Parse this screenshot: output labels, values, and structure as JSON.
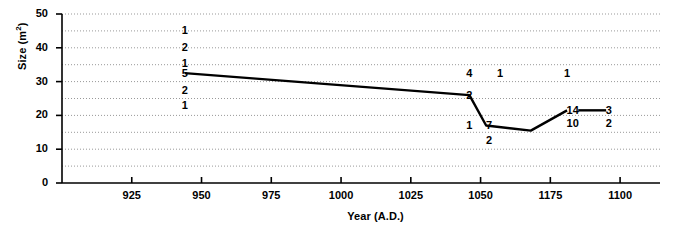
{
  "chart_data": {
    "type": "line",
    "title": "",
    "xlabel": "Year (A.D.)",
    "ylabel": "Size (m²)",
    "xlabel_parts": {
      "main": "Year (A.D.)"
    },
    "ylabel_parts": {
      "prefix": "Size (m",
      "superscript": "2",
      "suffix": ")"
    },
    "xlim": [
      900,
      1110
    ],
    "ylim": [
      0,
      50
    ],
    "xticks": [
      "925",
      "950",
      "975",
      "1000",
      "1025",
      "1050",
      "1175",
      "1100"
    ],
    "xtick_values": [
      925,
      950,
      975,
      1000,
      1025,
      1050,
      1075,
      1100
    ],
    "yticks": [
      "0",
      "10",
      "20",
      "30",
      "40",
      "50"
    ],
    "ytick_values": [
      0,
      10,
      20,
      30,
      40,
      50
    ],
    "grid": "horizontal dotted every 5 units",
    "gridline_values": [
      5,
      10,
      15,
      20,
      25,
      30,
      35,
      40,
      45,
      50
    ],
    "legend": "none",
    "series": [
      {
        "name": "Mean house size",
        "x": [
          944,
          1046,
          1052,
          1068,
          1081
        ],
        "y": [
          32.5,
          26.0,
          17.0,
          15.5,
          21.5
        ]
      },
      {
        "name": "Mean house size (late segment)",
        "x": [
          1085,
          1095
        ],
        "y": [
          21.5,
          21.5
        ]
      }
    ],
    "annotations": [
      {
        "label": "1",
        "x": 944,
        "y": 45.0
      },
      {
        "label": "2",
        "x": 944,
        "y": 40.0
      },
      {
        "label": "1",
        "x": 944,
        "y": 35.5
      },
      {
        "label": "5",
        "x": 944,
        "y": 32.5
      },
      {
        "label": "2",
        "x": 944,
        "y": 27.5
      },
      {
        "label": "1",
        "x": 944,
        "y": 23.0
      },
      {
        "label": "4",
        "x": 1046,
        "y": 32.5
      },
      {
        "label": "1",
        "x": 1057,
        "y": 32.5
      },
      {
        "label": "1",
        "x": 1081,
        "y": 32.5
      },
      {
        "label": "2",
        "x": 1046,
        "y": 26.0
      },
      {
        "label": "1",
        "x": 1046,
        "y": 17.0
      },
      {
        "label": "7",
        "x": 1053,
        "y": 17.0
      },
      {
        "label": "2",
        "x": 1053,
        "y": 12.5
      },
      {
        "label": "14",
        "x": 1083,
        "y": 21.5
      },
      {
        "label": "3",
        "x": 1096,
        "y": 21.5
      },
      {
        "label": "10",
        "x": 1083,
        "y": 17.5
      },
      {
        "label": "2",
        "x": 1096,
        "y": 17.5
      }
    ]
  },
  "axes": {
    "ylabel_text": "Size (m2)",
    "xlabel_text": "Year (A.D.)"
  },
  "style": {
    "line_color": "#000000",
    "grid_color": "#999999",
    "axis_color": "#000000",
    "background": "#ffffff"
  }
}
